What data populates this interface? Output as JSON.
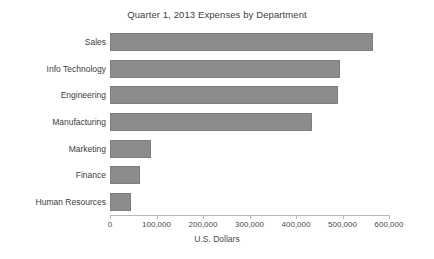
{
  "chart_data": {
    "type": "bar",
    "orientation": "horizontal",
    "title": "Quarter 1, 2013 Expenses by Department",
    "xlabel": "U.S. Dollars",
    "ylabel": "",
    "categories": [
      "Sales",
      "Info Technology",
      "Engineering",
      "Manufacturing",
      "Marketing",
      "Finance",
      "Human Resources"
    ],
    "values": [
      565000,
      495000,
      490000,
      435000,
      88000,
      65000,
      45000
    ],
    "xlim": [
      0,
      600000
    ],
    "xticks": [
      0,
      100000,
      200000,
      300000,
      400000,
      500000,
      600000
    ],
    "xtick_labels": [
      "0",
      "100,000",
      "200,000",
      "300,000",
      "400,000",
      "500,000",
      "600,000"
    ],
    "grid": false,
    "legend": null,
    "bar_color": "#8c8c8c",
    "bar_edge_color": "#7e7e7e",
    "background_color": "#ffffff",
    "text_color": "#404040",
    "axis_color": "#b9b9b9"
  }
}
